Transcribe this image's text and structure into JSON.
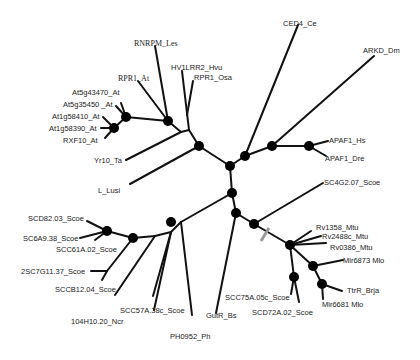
{
  "diagram": {
    "type": "unrooted phylogenetic tree",
    "colors": {
      "branch": "#111111",
      "node": "#000000",
      "label": "#222222",
      "break_mark": "#999999"
    },
    "taxa": {
      "rnrpm_les": "RNRPM_Les",
      "rpr1_at": "RPR1_At",
      "hv1lrr2_hvu": "HV1LRR2_Hvu",
      "rpr1_osa": "RPR1_Osa",
      "at5g43470_at": "At5g43470_At",
      "at5g35450_at": "At5g35450 _At",
      "at1g58410_at": "At1g58410_At",
      "at1g58390_at": "At1g58390_At",
      "rxf10_at": "RXF10_At",
      "yr10_ta": "Yr10_Ta",
      "l_lusi": "L_Lusi",
      "ced4_ce": "CED4_Ce",
      "arkd_dm": "ARKD_Dm",
      "apaf1_hs": "APAF1_Hs",
      "apaf1_dre": "APAF1_Dre",
      "sc4g2_07_scoe": "SC4G2.07_Scoe",
      "rv1358_mtu": "Rv1358_Mtu",
      "rv2488c_mtu": "Rv2488c_Mtu",
      "rv0386_mtu": "Rv0386_Mtu",
      "mlr6873_mlo": "Mlr6873 Mlo",
      "ttrr_brja": "TtrR_Brja",
      "mlr6681_mlo": "Mlr6681 Mlo",
      "scc75a_05c_scoe": "SCC75A.05c_Scoe",
      "scd72a_02_scoe": "SCD72A.02_Scoe",
      "gutr_bs": "GutR_Bs",
      "ph0952_ph": "PH0952_Ph",
      "scc57a_38c_scoe": "SCC57A.38c_Scoe",
      "104h10_20_ncr": "104H10.20_Ncr",
      "sccb12_04_scoe": "SCCB12.04_Scoe",
      "2sc7g11_37_scoe": "2SC7G11.37_Scoe",
      "scc61a_02_scoe": "SCC61A.02_Scoe",
      "sc6a9_38_scoe": "SC6A9.38_Scoe",
      "scd82_03_scoe": "SCD82.03_Scoe"
    }
  }
}
